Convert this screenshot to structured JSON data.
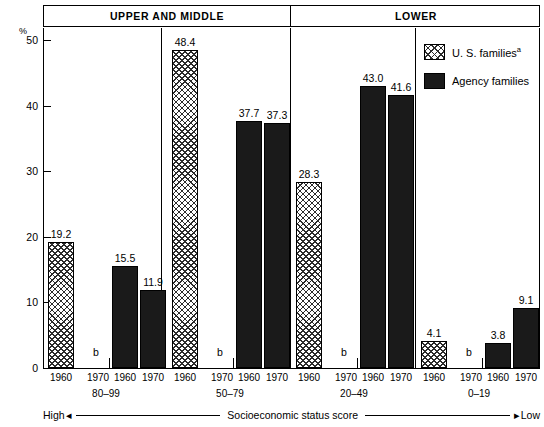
{
  "chart_data": {
    "type": "bar",
    "title": "",
    "xlabel": "Socioeconomic status score",
    "ylabel": "%",
    "ylim": [
      0,
      52
    ],
    "yticks": [
      0,
      10,
      20,
      30,
      40,
      50
    ],
    "grid": false,
    "legend_position": "inside-right",
    "categories": [
      "80–99",
      "50–79",
      "20–49",
      "0–19"
    ],
    "series": [
      {
        "name": "U. S. families",
        "fill": "hatched",
        "years": [
          "1960",
          "1970"
        ],
        "values_1960": [
          19.2,
          48.4,
          28.3,
          4.1
        ],
        "values_1970": [
          "b",
          "b",
          "b",
          "b"
        ]
      },
      {
        "name": "Agency families",
        "fill": "solid",
        "years": [
          "1960",
          "1970"
        ],
        "values_1960": [
          15.5,
          37.7,
          43.0,
          3.8
        ],
        "values_1970": [
          11.9,
          37.3,
          41.6,
          9.1
        ]
      }
    ],
    "bars": [
      {
        "group": "80–99",
        "series": "U. S. families",
        "year": "1960",
        "value": 19.2,
        "label": "19.2",
        "fill": "hatched"
      },
      {
        "group": "80–99",
        "series": "U. S. families",
        "year": "1970",
        "value": null,
        "label": "b",
        "fill": "none"
      },
      {
        "group": "80–99",
        "series": "Agency families",
        "year": "1960",
        "value": 15.5,
        "label": "15.5",
        "fill": "solid"
      },
      {
        "group": "80–99",
        "series": "Agency families",
        "year": "1970",
        "value": 11.9,
        "label": "11.9",
        "fill": "solid"
      },
      {
        "group": "50–79",
        "series": "U. S. families",
        "year": "1960",
        "value": 48.4,
        "label": "48.4",
        "fill": "hatched"
      },
      {
        "group": "50–79",
        "series": "U. S. families",
        "year": "1970",
        "value": null,
        "label": "b",
        "fill": "none"
      },
      {
        "group": "50–79",
        "series": "Agency families",
        "year": "1960",
        "value": 37.7,
        "label": "37.7",
        "fill": "solid"
      },
      {
        "group": "50–79",
        "series": "Agency families",
        "year": "1970",
        "value": 37.3,
        "label": "37.3",
        "fill": "solid"
      },
      {
        "group": "20–49",
        "series": "U. S. families",
        "year": "1960",
        "value": 28.3,
        "label": "28.3",
        "fill": "hatched"
      },
      {
        "group": "20–49",
        "series": "U. S. families",
        "year": "1970",
        "value": null,
        "label": "b",
        "fill": "none"
      },
      {
        "group": "20–49",
        "series": "Agency families",
        "year": "1960",
        "value": 43.0,
        "label": "43.0",
        "fill": "solid"
      },
      {
        "group": "20–49",
        "series": "Agency families",
        "year": "1970",
        "value": 41.6,
        "label": "41.6",
        "fill": "solid"
      },
      {
        "group": "0–19",
        "series": "U. S. families",
        "year": "1960",
        "value": 4.1,
        "label": "4.1",
        "fill": "hatched"
      },
      {
        "group": "0–19",
        "series": "U. S. families",
        "year": "1970",
        "value": null,
        "label": "b",
        "fill": "none"
      },
      {
        "group": "0–19",
        "series": "Agency families",
        "year": "1960",
        "value": 3.8,
        "label": "3.8",
        "fill": "solid"
      },
      {
        "group": "0–19",
        "series": "Agency families",
        "year": "1970",
        "value": 9.1,
        "label": "9.1",
        "fill": "solid"
      }
    ]
  },
  "header": {
    "sections": [
      {
        "label": "UPPER AND MIDDLE"
      },
      {
        "label": "LOWER"
      }
    ]
  },
  "axis": {
    "y_unit": "%",
    "y_ticks": [
      "50",
      "40",
      "30",
      "20",
      "10",
      "0"
    ],
    "x_years": [
      "1960",
      "1970",
      "1960",
      "1970"
    ],
    "group_labels": [
      "80–99",
      "50–79",
      "20–49",
      "0–19"
    ],
    "direction_left": "High",
    "direction_right": "Low",
    "direction_center": "Socioeconomic status score",
    "arrow_left": "◂",
    "arrow_right": "▸"
  },
  "legend": {
    "items": [
      {
        "label": "U. S. families",
        "footnote": "a",
        "fill": "hatched"
      },
      {
        "label": "Agency families",
        "footnote": "",
        "fill": "solid"
      }
    ]
  },
  "missing_marker": "b"
}
